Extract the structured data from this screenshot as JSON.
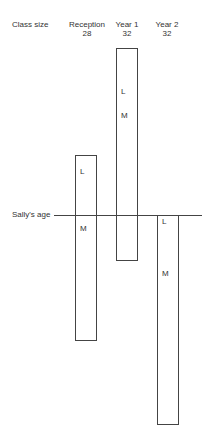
{
  "header": {
    "row_title": "Class size",
    "columns": [
      {
        "name": "Reception",
        "class_size": "28"
      },
      {
        "name": "Year 1",
        "class_size": "32"
      },
      {
        "name": "Year 2",
        "class_size": "32"
      }
    ]
  },
  "reference_line": {
    "label": "Sally's age"
  },
  "bars": [
    {
      "name": "Reception",
      "marks": [
        "L",
        "M"
      ]
    },
    {
      "name": "Year 1",
      "marks": [
        "L",
        "M"
      ]
    },
    {
      "name": "Year 2",
      "marks": [
        "L",
        "M"
      ]
    }
  ],
  "colors": {
    "stroke": "#444444",
    "text": "#333333",
    "background": "#ffffff"
  }
}
